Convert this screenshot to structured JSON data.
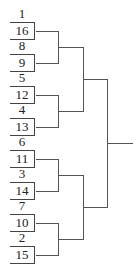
{
  "bracket": {
    "matchups": [
      {
        "top_seed": "1",
        "bottom_seed": "16"
      },
      {
        "top_seed": "8",
        "bottom_seed": "9"
      },
      {
        "top_seed": "5",
        "bottom_seed": "12"
      },
      {
        "top_seed": "4",
        "bottom_seed": "13"
      },
      {
        "top_seed": "6",
        "bottom_seed": "11"
      },
      {
        "top_seed": "3",
        "bottom_seed": "14"
      },
      {
        "top_seed": "7",
        "bottom_seed": "10"
      },
      {
        "top_seed": "2",
        "bottom_seed": "15"
      }
    ],
    "line_color": "#555555"
  }
}
